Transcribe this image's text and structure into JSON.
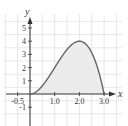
{
  "chart_data": {
    "type": "area",
    "title": "",
    "xlabel": "x",
    "ylabel": "y",
    "function_hint": "y = x^2 (3 - x)",
    "x": [
      0,
      0.25,
      0.5,
      0.75,
      1.0,
      1.25,
      1.5,
      1.75,
      2.0,
      2.25,
      2.5,
      2.75,
      3.0
    ],
    "series": [
      {
        "name": "curve",
        "values": [
          0,
          0.17,
          0.63,
          1.27,
          2.0,
          2.73,
          3.38,
          3.83,
          4.0,
          3.8,
          3.13,
          1.89,
          0
        ]
      }
    ],
    "shaded_region": {
      "from": 0,
      "to": 3.0,
      "between": "curve and x-axis"
    },
    "x_ticks": [
      "-0.5",
      "1.0",
      "2.0",
      "3.0"
    ],
    "y_ticks": [
      "5",
      "4",
      "3",
      "2",
      "1",
      "-1"
    ],
    "xlim": [
      -1.0,
      3.5
    ],
    "ylim": [
      -2.5,
      6
    ],
    "grid": true,
    "colors": {
      "curve": "#666666",
      "fill": "#ececec",
      "grid": "#d9d9d9",
      "axis": "#333333"
    }
  }
}
